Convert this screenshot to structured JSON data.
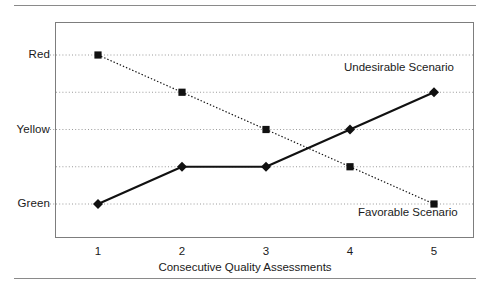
{
  "chart_data": {
    "type": "line",
    "title": "",
    "xlabel": "Consecutive Quality Assessments",
    "ylabel": "",
    "x": [
      1,
      2,
      3,
      4,
      5
    ],
    "xtick_labels": [
      "1",
      "2",
      "3",
      "4",
      "5"
    ],
    "ylim": [
      0.5,
      5.5
    ],
    "ytick_values": [
      1,
      2,
      3,
      4,
      5
    ],
    "ytick_labels": [
      "Green",
      "",
      "Yellow",
      "",
      "Red"
    ],
    "grid": "horizontal-dotted",
    "legend_position": "inline-annotations",
    "series": [
      {
        "name": "Favorable Scenario",
        "values": [
          5,
          4,
          3,
          2,
          1
        ],
        "line_style": "dotted",
        "marker": "square",
        "color": "#111111"
      },
      {
        "name": "Undesirable Scenario",
        "values": [
          1,
          2,
          2,
          3,
          4
        ],
        "line_style": "solid",
        "marker": "diamond",
        "color": "#111111"
      }
    ],
    "annotations": [
      {
        "text": "Undesirable Scenario",
        "x": 4.1,
        "y": 4.6
      },
      {
        "text": "Favorable Scenario",
        "x": 4.3,
        "y": 0.75
      }
    ]
  },
  "axes": {
    "y_labels": [
      {
        "text": "Red",
        "level": 5
      },
      {
        "text": "Yellow",
        "level": 3
      },
      {
        "text": "Green",
        "level": 1
      }
    ],
    "x_labels": [
      "1",
      "2",
      "3",
      "4",
      "5"
    ],
    "x_title": "Consecutive Quality Assessments"
  },
  "annotations": {
    "undesirable": "Undesirable Scenario",
    "favorable": "Favorable Scenario"
  },
  "style": {
    "ink": "#111111",
    "frame": "#7d7d7d",
    "grid": "#9a9a9a",
    "rule": "#8a8a8a"
  }
}
